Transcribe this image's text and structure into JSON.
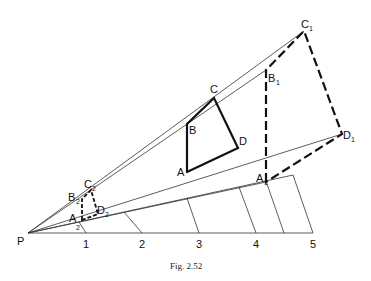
{
  "figure": {
    "caption": "Fig. 2.52",
    "origin_label": "P",
    "scale_labels": [
      "1",
      "2",
      "3",
      "4",
      "5"
    ],
    "shapes": {
      "original": {
        "A": "A",
        "B": "B",
        "C": "C",
        "D": "D"
      },
      "enlarged": {
        "A": "A",
        "A_sub": "1",
        "B": "B",
        "B_sub": "1",
        "C": "C",
        "C_sub": "1",
        "D": "D",
        "D_sub": "1"
      },
      "reduced": {
        "A": "A",
        "A_sub": "2",
        "B": "B",
        "B_sub": "2",
        "C": "C",
        "C_sub": "2",
        "D": "D",
        "D_sub": "2"
      }
    }
  }
}
